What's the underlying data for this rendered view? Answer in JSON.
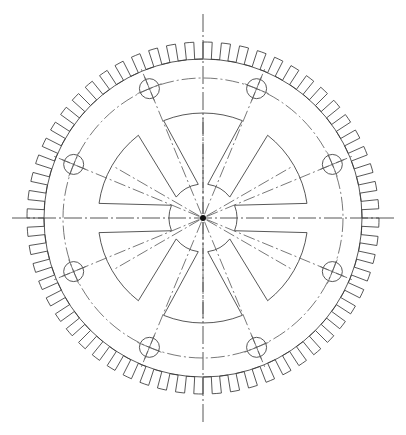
{
  "drawing": {
    "title": "Spur Gear Flywheel Plan View",
    "type": "engineering-orthographic-drawing",
    "projection": "front-view",
    "background_color": "#ffffff",
    "line_color": "#3a3a3a",
    "centerline_color": "#555555",
    "canvas": {
      "width": 406,
      "height": 435
    }
  },
  "geometry": {
    "center": {
      "x": 203,
      "y": 218
    },
    "outer_tip_radius": 176,
    "root_radius": 159,
    "tooth_count": 60,
    "tooth_width_ratio": 0.5,
    "rim_inner_radius": 152,
    "bolt_circle_radius": 140,
    "bolt_hole_count": 8,
    "bolt_hole_radius": 10,
    "bolt_hole_start_angle_deg": -67.5,
    "bolt_hole_step_deg": 45,
    "web_disc_radius": 105,
    "hub_radius": 4,
    "hub_dot_radius": 3,
    "spoke_count": 6,
    "spoke_start_angle_deg": -90,
    "spoke_step_deg": 60,
    "spoke_half_angle_outer_deg": 22,
    "spoke_half_angle_inner_deg": 9,
    "slot_half_angle_deg": 8,
    "slot_inner_radius": 34,
    "axis_overhang": 32
  },
  "centerlines": {
    "vertical": {
      "label": "vertical-centerline",
      "from_y": 14,
      "to_y": 424
    },
    "horizontal": {
      "label": "horizontal-centerline",
      "from_x": 12,
      "to_x": 396
    },
    "radial_count": 8,
    "radial_start_deg": -67.5,
    "radial_step_deg": 45,
    "dash_pattern": "12 3 2 3",
    "pitch_circle_dash": "14 3 2 3"
  },
  "annotations": {
    "hub_marker": "center-hub-dot",
    "pitch_circle": "bolt-circle-dash-dot",
    "rim": "gear-rim",
    "teeth": "square-tooth-profile"
  }
}
